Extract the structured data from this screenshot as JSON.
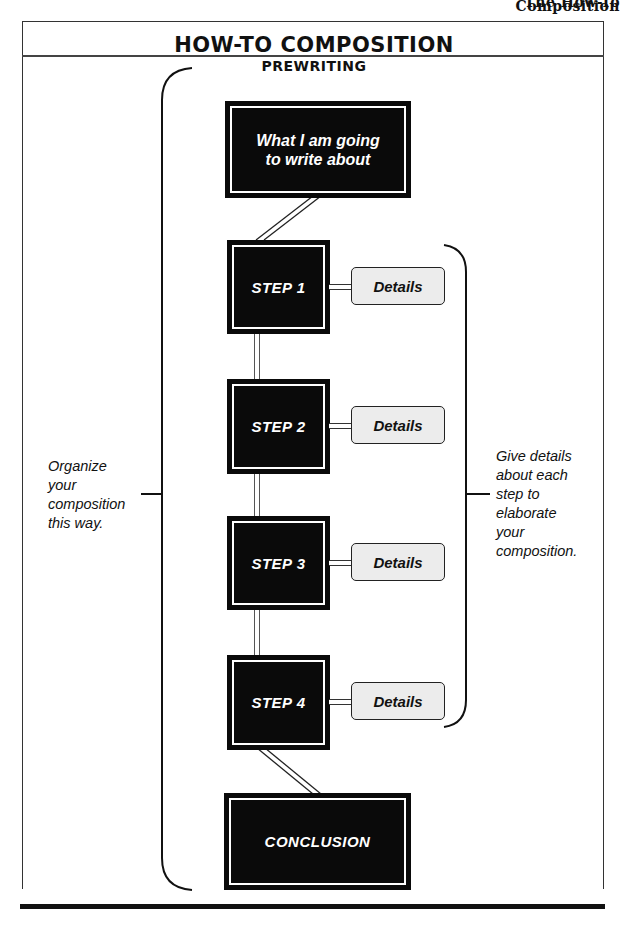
{
  "running_head": "The How-To Composition",
  "title": "HOW-TO COMPOSITION",
  "subtitle": "PREWRITING",
  "topic_box": {
    "line1": "What I am going",
    "line2": "to write about"
  },
  "steps": [
    {
      "label": "STEP 1",
      "details": "Details"
    },
    {
      "label": "STEP 2",
      "details": "Details"
    },
    {
      "label": "STEP 3",
      "details": "Details"
    },
    {
      "label": "STEP 4",
      "details": "Details"
    }
  ],
  "conclusion": "CONCLUSION",
  "left_note": {
    "lines": [
      "Organize",
      "your",
      "composition",
      "this way."
    ]
  },
  "right_note": {
    "lines": [
      "Give details",
      "about each",
      "step to",
      "elaborate",
      "your",
      "composition."
    ]
  },
  "colors": {
    "box_fill": "#0a0a0a",
    "box_text": "#ffffff",
    "details_fill": "#ececec",
    "line": "#111111"
  }
}
